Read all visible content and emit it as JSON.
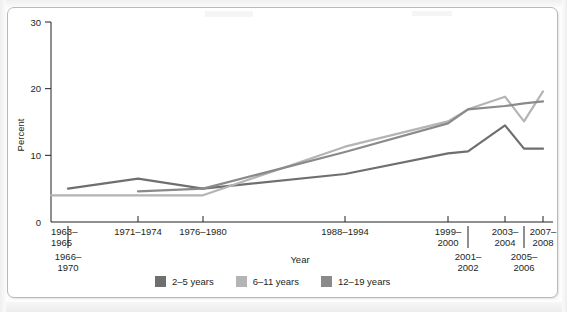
{
  "figure": {
    "axis": {
      "ylabel": "Percent",
      "xlabel": "Year",
      "yticks": [
        "0",
        "10",
        "20",
        "30"
      ],
      "ylim": [
        0,
        30
      ],
      "xticks_upper": [
        "1963–1965",
        "1971–1974",
        "1976–1980",
        "1988–1994",
        "1999–2000",
        "2003–2004",
        "2007–2008"
      ],
      "xticks_lower": [
        "1966–1970",
        "2001–2002",
        "2005–2006"
      ]
    },
    "legend": [
      {
        "label": "2–5 years",
        "color": "#6f6f6f"
      },
      {
        "label": "6–11 years",
        "color": "#b4b4b4"
      },
      {
        "label": "12–19 years",
        "color": "#8a8a8a"
      }
    ]
  },
  "chart_data": {
    "type": "line",
    "title": "",
    "xlabel": "Year",
    "ylabel": "Percent",
    "ylim": [
      0,
      30
    ],
    "grid": false,
    "legend_position": "bottom",
    "categories": [
      "1963–1965",
      "1966–1970",
      "1971–1974",
      "1976–1980",
      "1988–1994",
      "1999–2000",
      "2001–2002",
      "2003–2004",
      "2005–2006",
      "2007–2008"
    ],
    "series": [
      {
        "name": "2–5 years",
        "color": "#6f6f6f",
        "x": [
          "1966–1970",
          "1971–1974",
          "1976–1980",
          "1988–1994",
          "1999–2000",
          "2001–2002",
          "2003–2004",
          "2005–2006",
          "2007–2008"
        ],
        "values": [
          5.0,
          6.5,
          5.0,
          7.2,
          10.3,
          10.6,
          14.5,
          11.0,
          11.0
        ]
      },
      {
        "name": "6–11 years",
        "color": "#b4b4b4",
        "x": [
          "1963–1965",
          "1966–1970",
          "1971–1974",
          "1976–1980",
          "1988–1994",
          "1999–2000",
          "2001–2002",
          "2003–2004",
          "2005–2006",
          "2007–2008"
        ],
        "values": [
          4.0,
          4.0,
          4.0,
          4.0,
          11.3,
          15.1,
          16.9,
          18.8,
          15.1,
          19.6
        ]
      },
      {
        "name": "12–19 years",
        "color": "#8a8a8a",
        "x": [
          "1971–1974",
          "1976–1980",
          "1988–1994",
          "1999–2000",
          "2001–2002",
          "2003–2004",
          "2005–2006",
          "2007–2008"
        ],
        "values": [
          4.6,
          5.0,
          10.5,
          14.8,
          16.9,
          17.4,
          17.8,
          18.1
        ]
      }
    ]
  }
}
